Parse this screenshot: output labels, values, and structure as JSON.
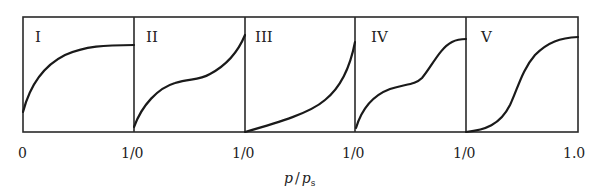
{
  "figure": {
    "type": "adsorption-isotherm-types",
    "panels": [
      {
        "id": "I",
        "label": "I",
        "shape": "concave, saturating plateau (Langmuir)"
      },
      {
        "id": "II",
        "label": "II",
        "shape": "concave knee then convex rise (sigmoid multilayer)"
      },
      {
        "id": "III",
        "label": "III",
        "shape": "convex throughout"
      },
      {
        "id": "IV",
        "label": "IV",
        "shape": "knee, plateau, second rise, final plateau"
      },
      {
        "id": "V",
        "label": "V",
        "shape": "convex start, S-shape, final plateau"
      }
    ],
    "x_ticks": [
      "0",
      "1/0",
      "1/0",
      "1/0",
      "1/0",
      "1.0"
    ],
    "x_axis_label_main": "p",
    "x_axis_label_slash": "/",
    "x_axis_label_denominator": "p",
    "x_axis_label_subscript": "s",
    "colors": {
      "line": "#1a1a1a",
      "frame": "#2a2a2a",
      "background": "#ffffff"
    }
  }
}
